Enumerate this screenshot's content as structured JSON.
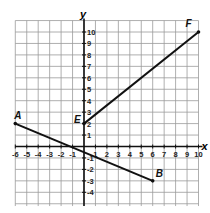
{
  "chart_data": {
    "type": "line",
    "title": "",
    "xlabel": "x",
    "ylabel": "y",
    "xlim": [
      -6,
      10
    ],
    "ylim": [
      -5,
      11
    ],
    "grid": true,
    "x_ticks": [
      -6,
      -5,
      -4,
      -3,
      -2,
      -1,
      1,
      2,
      3,
      4,
      5,
      6,
      7,
      8,
      9,
      10
    ],
    "y_ticks": [
      -4,
      -3,
      -2,
      -1,
      1,
      2,
      3,
      4,
      5,
      6,
      7,
      8,
      9,
      10
    ],
    "series": [
      {
        "name": "AB",
        "points": [
          {
            "label": "A",
            "x": -6,
            "y": 2
          },
          {
            "label": "B",
            "x": 6,
            "y": -3
          }
        ]
      },
      {
        "name": "EF",
        "points": [
          {
            "label": "E",
            "x": 0,
            "y": 2
          },
          {
            "label": "F",
            "x": 10,
            "y": 10
          }
        ]
      }
    ]
  },
  "labels": {
    "x_axis": "x",
    "y_axis": "y",
    "A": "A",
    "B": "B",
    "E": "E",
    "F": "F"
  },
  "colors": {
    "grid": "#9a9a9a",
    "axis": "#111111",
    "line": "#111111"
  }
}
